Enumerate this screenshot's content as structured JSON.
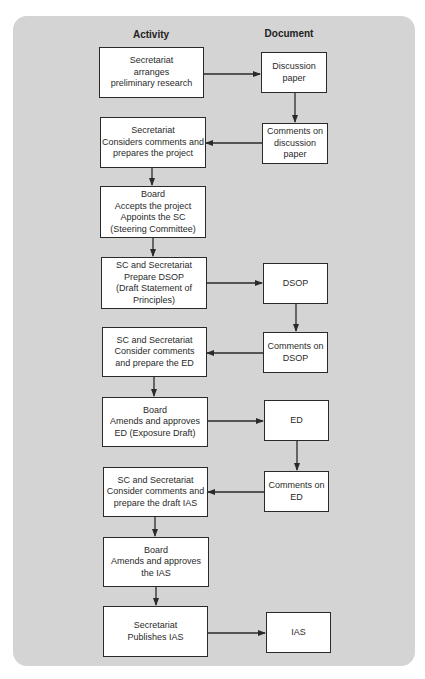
{
  "headers": {
    "activity": "Activity",
    "document": "Document"
  },
  "colors": {
    "panel_background": "#d4d4d4",
    "box_fill": "#ffffff",
    "line": "#2a2a2a"
  },
  "activities": [
    {
      "id": "a1",
      "text": "Secretariat\narranges\npreliminary research"
    },
    {
      "id": "a2",
      "text": "Secretariat\nConsiders comments and\nprepares the project"
    },
    {
      "id": "a3",
      "text": "Board\nAccepts the project\nAppoints the SC\n(Steering Committee)"
    },
    {
      "id": "a4",
      "text": "SC and Secretariat\nPrepare DSOP\n(Draft Statement of\nPrinciples)"
    },
    {
      "id": "a5",
      "text": "SC and Secretariat\nConsider comments\nand prepare the ED"
    },
    {
      "id": "a6",
      "text": "Board\nAmends and approves\nED (Exposure Draft)"
    },
    {
      "id": "a7",
      "text": "SC and Secretariat\nConsider comments and\nprepare the draft IAS"
    },
    {
      "id": "a8",
      "text": "Board\nAmends and approves\nthe IAS"
    },
    {
      "id": "a9",
      "text": "Secretariat\nPublishes IAS"
    }
  ],
  "documents": [
    {
      "id": "d1",
      "text": "Discussion\npaper"
    },
    {
      "id": "d2",
      "text": "Comments on\ndiscussion\npaper"
    },
    {
      "id": "d3",
      "text": "DSOP"
    },
    {
      "id": "d4",
      "text": "Comments on\nDSOP"
    },
    {
      "id": "d5",
      "text": "ED"
    },
    {
      "id": "d6",
      "text": "Comments on\nED"
    },
    {
      "id": "d7",
      "text": "IAS"
    }
  ],
  "connections": [
    {
      "from": "a1",
      "to": "d1"
    },
    {
      "from": "d1",
      "to": "d2"
    },
    {
      "from": "d2",
      "to": "a2"
    },
    {
      "from": "a2",
      "to": "a3"
    },
    {
      "from": "a3",
      "to": "a4"
    },
    {
      "from": "a4",
      "to": "d3"
    },
    {
      "from": "d3",
      "to": "d4"
    },
    {
      "from": "d4",
      "to": "a5"
    },
    {
      "from": "a5",
      "to": "a6"
    },
    {
      "from": "a6",
      "to": "d5"
    },
    {
      "from": "d5",
      "to": "d6"
    },
    {
      "from": "d6",
      "to": "a7"
    },
    {
      "from": "a7",
      "to": "a8"
    },
    {
      "from": "a8",
      "to": "a9"
    },
    {
      "from": "a9",
      "to": "d7"
    }
  ]
}
